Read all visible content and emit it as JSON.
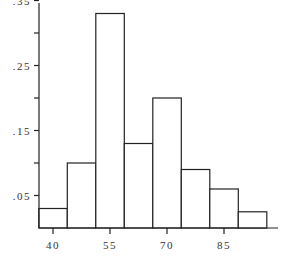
{
  "chart_data": {
    "type": "bar",
    "subtype": "histogram",
    "title": "",
    "xlabel": "",
    "ylabel": "",
    "bin_width": 7.5,
    "bin_centers": [
      40,
      47.5,
      55,
      62.5,
      70,
      77.5,
      85,
      92.5
    ],
    "bin_edges": [
      36.25,
      43.75,
      51.25,
      58.75,
      66.25,
      73.75,
      81.25,
      88.75,
      96.25
    ],
    "values": [
      0.03,
      0.1,
      0.33,
      0.13,
      0.2,
      0.09,
      0.06,
      0.025
    ],
    "x_ticks": [
      40,
      55,
      70,
      85
    ],
    "x_tick_labels": [
      "40",
      "55",
      "70",
      "85"
    ],
    "y_ticks": [
      0.05,
      0.1,
      0.15,
      0.2,
      0.25,
      0.3,
      0.35
    ],
    "y_tick_labels": [
      ".05",
      "",
      ".15",
      "",
      ".25",
      "",
      ".35"
    ],
    "ylim": [
      0,
      0.36
    ],
    "xlim": [
      36.25,
      99.5
    ],
    "grid": false,
    "legend": null
  },
  "colors": {
    "bar_fill": "#ffffff",
    "bar_stroke": "#222222",
    "axis": "#222222",
    "text": "#333333"
  }
}
